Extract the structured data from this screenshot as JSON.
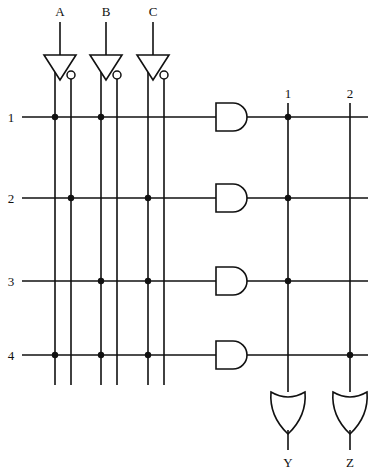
{
  "diagram": {
    "kind": "pla-logic-array",
    "title": "",
    "line_color": "#111111",
    "background": "#ffffff",
    "inputs": [
      {
        "label": "A",
        "x": 60,
        "label_y": 15,
        "stem_top": 22,
        "inverter_y": 55,
        "true_col_x": 55,
        "not_col_x": 71
      },
      {
        "label": "B",
        "x": 106,
        "label_y": 15,
        "stem_top": 22,
        "inverter_y": 55,
        "true_col_x": 101,
        "not_col_x": 117
      },
      {
        "label": "C",
        "x": 153,
        "label_y": 15,
        "stem_top": 22,
        "inverter_y": 55,
        "true_col_x": 148,
        "not_col_x": 164
      }
    ],
    "input_columns": [
      {
        "id": "col-a-true",
        "signal": "A",
        "x": 55
      },
      {
        "id": "col-a-not",
        "signal": "A'",
        "x": 71
      },
      {
        "id": "col-b-true",
        "signal": "B",
        "x": 101
      },
      {
        "id": "col-b-not",
        "signal": "B'",
        "x": 117
      },
      {
        "id": "col-c-true",
        "signal": "C",
        "x": 148
      },
      {
        "id": "col-c-not",
        "signal": "C'",
        "x": 164
      }
    ],
    "column_span": {
      "top": 72,
      "bottom": 385
    },
    "product_rows": [
      {
        "label": "1",
        "y": 117,
        "label_x": 11,
        "line_x1": 22,
        "line_x2": 368,
        "connections": [
          55,
          101
        ]
      },
      {
        "label": "2",
        "y": 198,
        "label_x": 11,
        "line_x1": 22,
        "line_x2": 368,
        "connections": [
          71,
          148
        ]
      },
      {
        "label": "3",
        "y": 281,
        "label_x": 11,
        "line_x1": 22,
        "line_x2": 368,
        "connections": [
          101,
          148
        ]
      },
      {
        "label": "4",
        "y": 355,
        "label_x": 11,
        "line_x1": 22,
        "line_x2": 368,
        "connections": [
          55,
          101,
          148
        ]
      }
    ],
    "and_gates": [
      {
        "row": "1",
        "x": 216,
        "y": 117,
        "w": 34,
        "h": 28
      },
      {
        "row": "2",
        "x": 216,
        "y": 198,
        "w": 34,
        "h": 28
      },
      {
        "row": "3",
        "x": 216,
        "y": 281,
        "w": 34,
        "h": 28
      },
      {
        "row": "4",
        "x": 216,
        "y": 355,
        "w": 34,
        "h": 28
      }
    ],
    "output_columns": [
      {
        "label": "1",
        "x": 288,
        "label_y": 97,
        "top": 103,
        "bottom": 385,
        "connections": [
          117,
          198,
          281
        ]
      },
      {
        "label": "2",
        "x": 350,
        "label_y": 97,
        "top": 103,
        "bottom": 385,
        "connections": [
          355
        ]
      }
    ],
    "or_gates": [
      {
        "output": "Y",
        "x": 288,
        "top": 392,
        "w": 34,
        "h": 34,
        "label_y": 464,
        "stem_bottom": 448
      },
      {
        "output": "Z",
        "x": 350,
        "top": 392,
        "w": 34,
        "h": 34,
        "label_y": 464,
        "stem_bottom": 448
      }
    ],
    "outputs": [
      {
        "label": "Y",
        "x": 288,
        "y": 464
      },
      {
        "label": "Z",
        "x": 350,
        "y": 464
      }
    ]
  }
}
